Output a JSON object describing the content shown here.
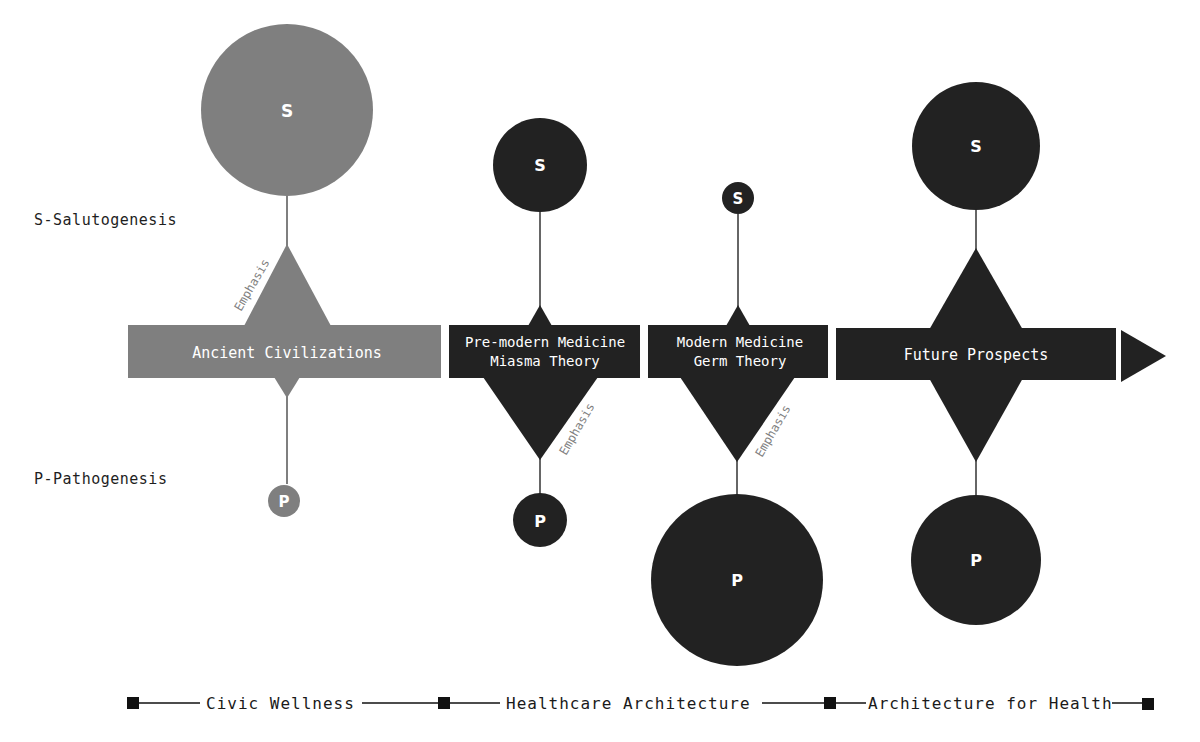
{
  "side_labels": {
    "salutogenesis": "S-Salutogenesis",
    "pathogenesis": "P-Pathogenesis"
  },
  "colors": {
    "ancient": "#7f7f7f",
    "dark": "#222222",
    "text_on_shape": "#ffffff",
    "line": "#333333"
  },
  "stages": [
    {
      "label_line1": "Ancient Civilizations",
      "label_line2": "",
      "s_symbol": "S",
      "p_symbol": "P",
      "emphasis": "Emphasis",
      "emphasis_on": "S",
      "s_relative_size": "large",
      "p_relative_size": "small"
    },
    {
      "label_line1": "Pre-modern Medicine",
      "label_line2": "Miasma Theory",
      "s_symbol": "S",
      "p_symbol": "P",
      "emphasis": "Emphasis",
      "emphasis_on": "P",
      "s_relative_size": "medium",
      "p_relative_size": "medium-small"
    },
    {
      "label_line1": "Modern Medicine",
      "label_line2": "Germ Theory",
      "s_symbol": "S",
      "p_symbol": "P",
      "emphasis": "Emphasis",
      "emphasis_on": "P",
      "s_relative_size": "small",
      "p_relative_size": "large"
    },
    {
      "label_line1": "Future Prospects",
      "label_line2": "",
      "s_symbol": "S",
      "p_symbol": "P",
      "emphasis": "",
      "emphasis_on": "balanced",
      "s_relative_size": "medium-large",
      "p_relative_size": "medium-large"
    }
  ],
  "legend": {
    "items": [
      "Civic Wellness",
      "Healthcare Architecture",
      "Architecture for Health"
    ]
  }
}
